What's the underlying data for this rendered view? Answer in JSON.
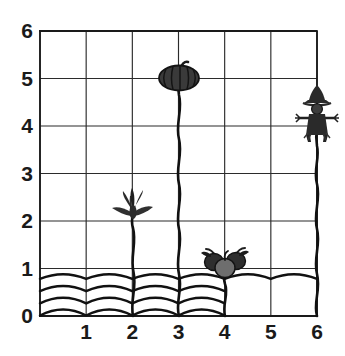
{
  "chart_data": {
    "type": "scatter",
    "title": "",
    "subtitle": "",
    "xlabel": "",
    "ylabel": "",
    "xlim": [
      0,
      6
    ],
    "ylim": [
      0,
      6
    ],
    "grid": true,
    "legend_position": "none",
    "x_ticks": [
      "1",
      "2",
      "3",
      "4",
      "5",
      "6"
    ],
    "x_tick_values": [
      1,
      2,
      3,
      4,
      5,
      6
    ],
    "y_ticks": [
      "0",
      "1",
      "2",
      "3",
      "4",
      "5",
      "6"
    ],
    "y_tick_values": [
      0,
      1,
      2,
      3,
      4,
      5,
      6
    ],
    "origin_label": "0",
    "points": [
      {
        "label": "corn-plant",
        "icon": "corn-icon",
        "x": 2,
        "y": 2
      },
      {
        "label": "pumpkin",
        "icon": "pumpkin-icon",
        "x": 3,
        "y": 5
      },
      {
        "label": "berries",
        "icon": "berries-icon",
        "x": 4,
        "y": 1
      },
      {
        "label": "scarecrow",
        "icon": "scarecrow-icon",
        "x": 6,
        "y": 4
      }
    ],
    "series": [
      {
        "name": "garden items",
        "x": [
          2,
          3,
          4,
          6
        ],
        "y": [
          2,
          5,
          1,
          4
        ]
      }
    ],
    "ground": {
      "name": "soil-waves",
      "wave_count": 4,
      "y_top": 0.85,
      "y_bottom": 0.1
    }
  },
  "colors": {
    "background": "#ffffff",
    "grid": "#2b2b2b",
    "axis": "#1a1a1a",
    "text": "#1a1a1a",
    "stem": "#111111",
    "pumpkin": "#3a3a3a",
    "pumpkin_dark": "#1c1c1c",
    "berry_dark": "#2e2e2e",
    "berry_light": "#6e6e6e",
    "scarecrow": "#2a2a2a",
    "corn": "#303030"
  },
  "axis_labels": {
    "x_axis_name": "x-axis",
    "y_axis_name": "y-axis"
  }
}
